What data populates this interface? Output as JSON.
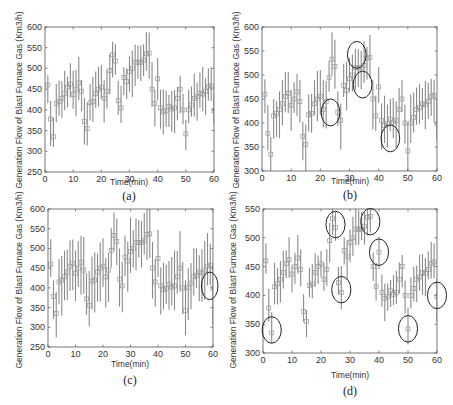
{
  "figure": {
    "panels_count": 4,
    "shared_center_series_note": "same center values in all panels"
  },
  "chart_data": [
    {
      "type": "scatter",
      "panel": "(a)",
      "title": "",
      "xlabel": "Time(min)",
      "ylabel": "Generation Flow of Blast Furnace Gas (Km3/h)",
      "xlim": [
        0,
        60
      ],
      "ylim": [
        250,
        600
      ],
      "xticks": [
        0,
        10,
        20,
        30,
        40,
        50,
        60
      ],
      "yticks": [
        250,
        300,
        350,
        400,
        450,
        500,
        550,
        600
      ],
      "grid": false,
      "legend": null,
      "interval_halfwidth": 45,
      "series": [
        {
          "name": "prediction (squares) with interval bars"
        }
      ],
      "highlight_circles": []
    },
    {
      "type": "scatter",
      "panel": "(b)",
      "title": "",
      "xlabel": "Time(min)",
      "ylabel": "Generation Flow of Blast Furnace Gas (Km3/h)",
      "xlim": [
        0,
        60
      ],
      "ylim": [
        300,
        600
      ],
      "xticks": [
        0,
        10,
        20,
        30,
        40,
        50,
        60
      ],
      "yticks": [
        300,
        350,
        400,
        450,
        500,
        550,
        600
      ],
      "grid": false,
      "legend": null,
      "interval_halfwidth": 42,
      "series": [
        {
          "name": "prediction (squares) with interval bars"
        }
      ],
      "highlight_circles": [
        {
          "x": 23.5,
          "y": 422,
          "rx": 3.2,
          "ry": 28
        },
        {
          "x": 32.5,
          "y": 542,
          "rx": 3.2,
          "ry": 28
        },
        {
          "x": 34.5,
          "y": 480,
          "rx": 3.2,
          "ry": 28
        },
        {
          "x": 44,
          "y": 368,
          "rx": 3.2,
          "ry": 28
        }
      ]
    },
    {
      "type": "scatter",
      "panel": "(c)",
      "title": "",
      "xlabel": "Time(min)",
      "ylabel": "Generation Flow of Blast Furnace Gas (Km3/h)",
      "xlim": [
        0,
        60
      ],
      "ylim": [
        250,
        600
      ],
      "xticks": [
        0,
        10,
        20,
        30,
        40,
        50,
        60
      ],
      "yticks": [
        250,
        300,
        350,
        400,
        450,
        500,
        550,
        600
      ],
      "grid": false,
      "legend": null,
      "interval_halfwidth": 62,
      "series": [
        {
          "name": "prediction (squares) with interval bars"
        }
      ],
      "highlight_circles": [
        {
          "x": 58.8,
          "y": 405,
          "rx": 3.0,
          "ry": 35
        }
      ]
    },
    {
      "type": "scatter",
      "panel": "(d)",
      "title": "",
      "xlabel": "Time(min)",
      "ylabel": "Generation Flow of Blast Furnace Gas (Km3/h)",
      "xlim": [
        0,
        60
      ],
      "ylim": [
        300,
        550
      ],
      "xticks": [
        0,
        10,
        20,
        30,
        40,
        50,
        60
      ],
      "yticks": [
        300,
        350,
        400,
        450,
        500,
        550
      ],
      "grid": false,
      "legend": null,
      "interval_halfwidth": 30,
      "series": [
        {
          "name": "prediction (squares) with interval bars"
        }
      ],
      "highlight_circles": [
        {
          "x": 3,
          "y": 340,
          "rx": 3.3,
          "ry": 23
        },
        {
          "x": 25,
          "y": 523,
          "rx": 3.3,
          "ry": 23
        },
        {
          "x": 27,
          "y": 410,
          "rx": 3.3,
          "ry": 23
        },
        {
          "x": 37,
          "y": 528,
          "rx": 3.3,
          "ry": 23
        },
        {
          "x": 40,
          "y": 475,
          "rx": 3.3,
          "ry": 23
        },
        {
          "x": 50,
          "y": 342,
          "rx": 3.3,
          "ry": 23
        },
        {
          "x": 60,
          "y": 400,
          "rx": 3.3,
          "ry": 23
        }
      ]
    }
  ],
  "center_values": {
    "x": [
      1,
      2,
      3,
      4,
      5,
      6,
      7,
      8,
      9,
      10,
      11,
      12,
      13,
      14,
      15,
      16,
      17,
      18,
      19,
      20,
      21,
      22,
      23,
      24,
      25,
      26,
      27,
      28,
      29,
      30,
      31,
      32,
      33,
      34,
      35,
      36,
      37,
      38,
      39,
      40,
      41,
      42,
      43,
      44,
      45,
      46,
      47,
      48,
      49,
      50,
      51,
      52,
      53,
      54,
      55,
      56,
      57,
      58,
      59,
      60
    ],
    "y": [
      460,
      378,
      335,
      415,
      420,
      428,
      440,
      455,
      462,
      437,
      450,
      465,
      445,
      372,
      355,
      417,
      420,
      440,
      450,
      455,
      428,
      445,
      495,
      533,
      518,
      422,
      405,
      478,
      468,
      492,
      500,
      515,
      515,
      515,
      520,
      535,
      537,
      450,
      415,
      475,
      405,
      395,
      398,
      408,
      402,
      405,
      428,
      450,
      400,
      342,
      400,
      412,
      428,
      432,
      440,
      438,
      445,
      455,
      458,
      398
    ]
  },
  "panels": [
    {
      "caption": "(a)",
      "xlabel": "Time(min)",
      "ylabel": "Generation Flow of Blast Furnace Gas (Km3/h)"
    },
    {
      "caption": "(b)",
      "xlabel": "Time(min)",
      "ylabel": "Generation Flow of Blast Furnace Gas (Km3/h)"
    },
    {
      "caption": "(c)",
      "xlabel": "Time(min)",
      "ylabel": "Generation Flow of Blast Furnace Gas (Km3/h)"
    },
    {
      "caption": "(d)",
      "xlabel": "Time(min)",
      "ylabel": "Generation Flow of Blast Furnace Gas (Km3/h)"
    }
  ],
  "colors": {
    "bar": "#8a8a8a",
    "marker": "#9a9a9a",
    "axis": "#555555",
    "circle": "#222222"
  }
}
